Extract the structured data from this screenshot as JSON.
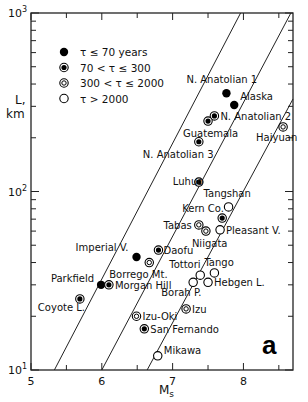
{
  "chart_data": {
    "type": "scatter",
    "title": "",
    "panel_label": "a",
    "xlabel": "M",
    "xlabel_sub": "s",
    "ylabel": "L,",
    "ylabel_unit": "km",
    "xlim": [
      5,
      8.7
    ],
    "ylim": [
      10,
      1000
    ],
    "yscale": "log",
    "x_ticks": [
      5,
      6,
      7,
      8
    ],
    "x_minor_ticks": [
      5.5,
      6.5,
      7.5,
      8.5
    ],
    "y_ticks": [
      {
        "value": 10,
        "base": "10",
        "exp": "1"
      },
      {
        "value": 100,
        "base": "10",
        "exp": "2"
      },
      {
        "value": 1000,
        "base": "10",
        "exp": "3"
      }
    ],
    "grid": false,
    "legend": {
      "placement": "top-left",
      "entries": [
        {
          "symbol": "filled",
          "label": "τ ≤ 70 years"
        },
        {
          "symbol": "dotted",
          "label": "70 < τ ≤ 300"
        },
        {
          "symbol": "concentric",
          "label": "300 < τ ≤ 2000"
        },
        {
          "symbol": "open",
          "label": "τ > 2000"
        }
      ]
    },
    "reference_lines": [
      {
        "from": [
          5.33,
          10
        ],
        "to": [
          7.96,
          1000
        ]
      },
      {
        "from": [
          6.0,
          10
        ],
        "to": [
          8.67,
          1000
        ]
      },
      {
        "from": [
          6.64,
          10
        ],
        "to": [
          8.7,
          330
        ]
      }
    ],
    "points": [
      {
        "name": "N. Anatolian 1",
        "ms": 7.76,
        "l": 355,
        "symbol": "filled"
      },
      {
        "name": "Alaska",
        "ms": 7.87,
        "l": 305,
        "symbol": "filled"
      },
      {
        "name": "N. Anatolian 2",
        "ms": 7.59,
        "l": 265,
        "symbol": "dotted"
      },
      {
        "name": "Guatemala",
        "ms": 7.5,
        "l": 248,
        "symbol": "dotted"
      },
      {
        "name": "N. Anatolian 3",
        "ms": 7.37,
        "l": 190,
        "symbol": "dotted"
      },
      {
        "name": "Haiyuan",
        "ms": 8.56,
        "l": 230,
        "symbol": "concentric"
      },
      {
        "name": "Luhuo",
        "ms": 7.37,
        "l": 113,
        "symbol": "dotted"
      },
      {
        "name": "Tangshan",
        "ms": 7.79,
        "l": 82,
        "symbol": "open"
      },
      {
        "name": "Kern Co.",
        "ms": 7.7,
        "l": 71,
        "symbol": "dotted"
      },
      {
        "name": "Tabas",
        "ms": 7.37,
        "l": 65,
        "symbol": "concentric"
      },
      {
        "name": "Niigata",
        "ms": 7.47,
        "l": 60,
        "symbol": "concentric"
      },
      {
        "name": "Pleasant V.",
        "ms": 7.67,
        "l": 61,
        "symbol": "open"
      },
      {
        "name": "Imperial V.",
        "ms": 6.49,
        "l": 43,
        "symbol": "filled"
      },
      {
        "name": "Daofu",
        "ms": 6.8,
        "l": 47,
        "symbol": "dotted"
      },
      {
        "name": "Borrego Mt.",
        "ms": 6.67,
        "l": 40,
        "symbol": "concentric"
      },
      {
        "name": "Tango",
        "ms": 7.59,
        "l": 35,
        "symbol": "open"
      },
      {
        "name": "Tottori",
        "ms": 7.39,
        "l": 34,
        "symbol": "open"
      },
      {
        "name": "Hebgen L.",
        "ms": 7.5,
        "l": 31,
        "symbol": "open"
      },
      {
        "name": "Borah P.",
        "ms": 7.29,
        "l": 31,
        "symbol": "open"
      },
      {
        "name": "Parkfield",
        "ms": 5.99,
        "l": 30,
        "symbol": "filled"
      },
      {
        "name": "Morgan Hill",
        "ms": 6.1,
        "l": 30,
        "symbol": "dotted"
      },
      {
        "name": "Coyote L.",
        "ms": 5.69,
        "l": 25,
        "symbol": "dotted"
      },
      {
        "name": "Izu",
        "ms": 7.19,
        "l": 22,
        "symbol": "concentric"
      },
      {
        "name": "Izu-Oki",
        "ms": 6.49,
        "l": 20,
        "symbol": "concentric"
      },
      {
        "name": "San Fernando",
        "ms": 6.6,
        "l": 17,
        "symbol": "dotted"
      },
      {
        "name": "Mikawa",
        "ms": 6.79,
        "l": 12,
        "symbol": "open"
      }
    ]
  }
}
